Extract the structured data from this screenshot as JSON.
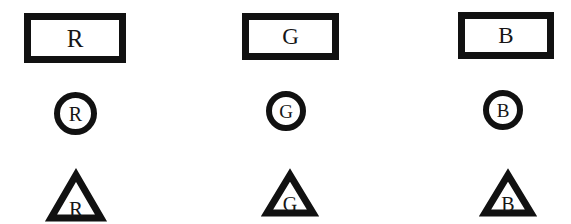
{
  "figure": {
    "background_color": "#ffffff",
    "ink_color": "#111111",
    "glyph_color": "#161616",
    "columns": [
      "R",
      "G",
      "B"
    ],
    "rows": [
      "rectangle",
      "circle",
      "triangle"
    ]
  },
  "symbols": {
    "rect_r": {
      "label": "R"
    },
    "rect_g": {
      "label": "G"
    },
    "rect_b": {
      "label": "B"
    },
    "circle_r": {
      "label": "R"
    },
    "circle_g": {
      "label": "G"
    },
    "circle_b": {
      "label": "B"
    },
    "tri_r": {
      "label": "R"
    },
    "tri_g": {
      "label": "G"
    },
    "tri_b": {
      "label": "B"
    }
  }
}
